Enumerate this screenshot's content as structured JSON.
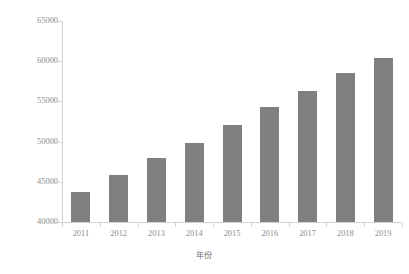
{
  "chart_data": {
    "type": "bar",
    "title": "",
    "xlabel": "年份",
    "ylabel": "建成区面积(km²)",
    "categories": [
      "2011",
      "2012",
      "2013",
      "2014",
      "2015",
      "2016",
      "2017",
      "2018",
      "2019"
    ],
    "values": [
      43700,
      45800,
      47900,
      49800,
      52100,
      54300,
      56300,
      58500,
      60400
    ],
    "series": [
      {
        "name": "建成区面积",
        "values": [
          43700,
          45800,
          47900,
          49800,
          52100,
          54300,
          56300,
          58500,
          60400
        ]
      }
    ],
    "ylim": [
      40000,
      65000
    ],
    "ytick_labels": [
      "40000",
      "45000",
      "50000",
      "55000",
      "60000",
      "65000"
    ],
    "ytick_values": [
      40000,
      45000,
      50000,
      55000,
      60000,
      65000
    ],
    "grid": false,
    "legend": false,
    "legend_position": "none",
    "bar_color": "#808080",
    "axis_color": "#d2d2d2",
    "text_color": "#8d8d8d"
  }
}
